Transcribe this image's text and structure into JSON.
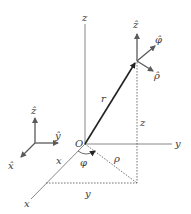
{
  "diagram": {
    "colors": {
      "axis": "#7a7a7a",
      "vector": "#222222",
      "unit_vector": "#5a5a5a",
      "dashed": "#555555",
      "text": "#3a3a3a"
    },
    "labels": {
      "origin": "O",
      "z_axis": "z",
      "y_axis": "y",
      "x_axis": "x",
      "position_vector": "r",
      "height": "z",
      "radial_distance": "ρ",
      "azimuth": "φ",
      "x_component": "x",
      "y_component": "y",
      "unit_z_at_point": "ẑ",
      "unit_phi": "φ̂",
      "unit_rho": "ρ̂",
      "frame_unit_z": "ẑ",
      "frame_unit_y": "ŷ",
      "frame_unit_x": "x̂"
    }
  }
}
